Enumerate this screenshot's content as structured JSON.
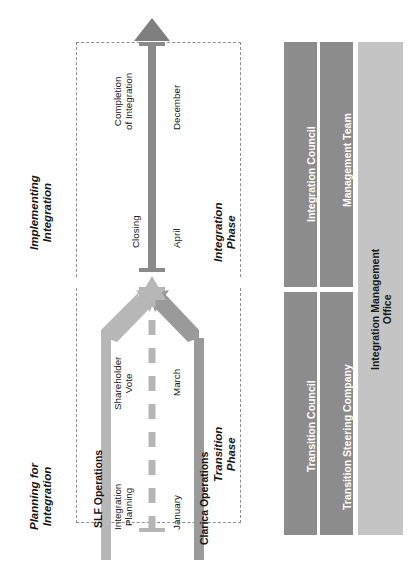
{
  "diagram": {
    "orientation": "rotated-90",
    "phases": [
      {
        "id": "planning",
        "label": "Planning for\nIntegration",
        "line1": "Planning for",
        "line2": "Integration"
      },
      {
        "id": "implementing",
        "label": "Implementing\nIntegration",
        "line1": "Implementing",
        "line2": "Integration"
      }
    ],
    "phase_boxes": [
      {
        "id": "transition-phase",
        "line1": "Transition",
        "line2": "Phase"
      },
      {
        "id": "integration-phase",
        "line1": "Integration",
        "line2": "Phase"
      }
    ],
    "streams": [
      {
        "id": "slf-operations",
        "label": "SLF Operations"
      },
      {
        "id": "clarica-operations",
        "label": "Clarica Operations"
      }
    ],
    "milestones": [
      {
        "id": "integration-planning",
        "line1": "Integration",
        "line2": "Planning",
        "month": "January"
      },
      {
        "id": "shareholder-vote",
        "line1": "Shareholder",
        "line2": "Vote",
        "month": "March"
      },
      {
        "id": "closing",
        "line1": "Closing",
        "line2": "",
        "month": "April"
      },
      {
        "id": "completion",
        "line1": "Completion",
        "line2": "of Integration",
        "month": "December"
      }
    ],
    "governance": {
      "columns": [
        {
          "id": "council",
          "color": "#8c8c8c",
          "segments": [
            {
              "id": "transition-council",
              "label": "Transition Council"
            },
            {
              "id": "integration-council",
              "label": "Integration Council"
            }
          ]
        },
        {
          "id": "steering",
          "color": "#8c8c8c",
          "segments": [
            {
              "id": "transition-steering-company",
              "label": "Transition Steering Company"
            },
            {
              "id": "management-team",
              "label": "Management Team"
            }
          ]
        },
        {
          "id": "office",
          "color": "#c4c4c4",
          "segments": [
            {
              "id": "integration-management-office",
              "line1": "Integration Management",
              "line2": "Office"
            }
          ]
        }
      ]
    },
    "colors": {
      "arrow_light": "#b7b7b7",
      "arrow_mid": "#9a9a9a",
      "timeline_dark": "#8a8a8a",
      "dashed_border": "#8e8e8e",
      "bar_dark": "#8c8c8c",
      "bar_light": "#c4c4c4",
      "text_dark": "#161616",
      "text_white": "#ffffff"
    }
  }
}
